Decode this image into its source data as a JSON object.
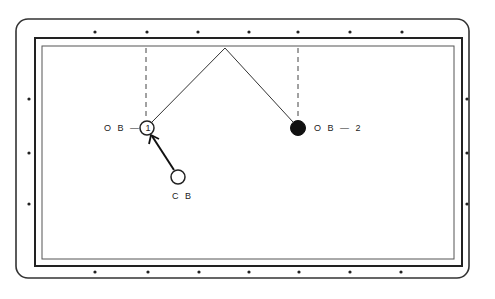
{
  "diagram": {
    "type": "billiard-table-shot",
    "table": {
      "outer_rail": {
        "x": 16,
        "y": 19,
        "w": 453,
        "h": 259,
        "radius": 12
      },
      "cushion": {
        "x": 35,
        "y": 38,
        "w": 427,
        "h": 228
      },
      "playing_surface": {
        "x": 42,
        "y": 46,
        "w": 412,
        "h": 213
      }
    },
    "diamonds": {
      "top": [
        95,
        147,
        198,
        249,
        298,
        350,
        402
      ],
      "bottom": [
        95,
        147,
        198,
        249,
        298,
        350,
        402
      ],
      "left": [
        99,
        153,
        204
      ],
      "right": [
        99,
        153,
        204
      ]
    },
    "balls": {
      "ob1": {
        "label": "O B — 1",
        "cx": 147,
        "cy": 128,
        "r": 7,
        "filled": false
      },
      "ob2": {
        "label": "O B — 2",
        "cx": 298,
        "cy": 128,
        "r": 7,
        "filled": true
      },
      "cb": {
        "label": "C B",
        "cx": 178,
        "cy": 177,
        "r": 7,
        "filled": false
      }
    },
    "paths": {
      "ob1_to_rail": {
        "x1": 152,
        "y1": 122,
        "x2": 225,
        "y2": 48
      },
      "rail_to_ob2": {
        "x1": 225,
        "y1": 48,
        "x2": 293,
        "y2": 122
      },
      "cb_to_ob1_arrow": {
        "x1": 174,
        "y1": 170,
        "x2": 152,
        "y2": 135
      }
    },
    "dashed_guides": [
      {
        "x": 146,
        "y1": 47,
        "y2": 120
      },
      {
        "x": 298,
        "y1": 47,
        "y2": 120
      }
    ],
    "labels": {
      "ob1": "O B — 1",
      "ob2": "O B — 2",
      "cb": "C B"
    }
  }
}
